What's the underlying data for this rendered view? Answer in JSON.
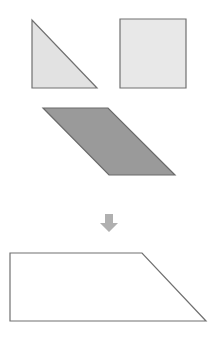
{
  "diagram": {
    "stroke_color": "#707070",
    "shapes": {
      "triangle": {
        "label": "right triangle",
        "points": "32,20 32,88 97,88",
        "fill": "#e2e2e2"
      },
      "square": {
        "label": "square",
        "points": "120,19 186,19 186,88 120,88",
        "fill": "#e8e8e8"
      },
      "parallelogram": {
        "label": "parallelogram",
        "points": "43,108 108,108 175,175 109,175",
        "fill": "#9a9a9a"
      },
      "arrow": {
        "label": "down arrow",
        "direction": "down",
        "fill": "#b0b0b0",
        "points": "105,214 113,214 113,223 118,223 109,232 100,223 105,223"
      },
      "result": {
        "label": "composite trapezoid",
        "points": "10,253 142,253 206,321 10,321",
        "fill": "#ffffff"
      }
    }
  }
}
